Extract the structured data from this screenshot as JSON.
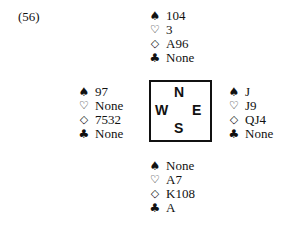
{
  "problem_label": "(56)",
  "suit_symbols": {
    "spades": "♠",
    "hearts": "♡",
    "diamonds": "◇",
    "clubs": "♣"
  },
  "compass": {
    "north": "N",
    "west": "W",
    "east": "E",
    "south": "S"
  },
  "hands": {
    "north": {
      "spades": "104",
      "hearts": "3",
      "diamonds": "A96",
      "clubs": "None"
    },
    "west": {
      "spades": "97",
      "hearts": "None",
      "diamonds": "7532",
      "clubs": "None"
    },
    "east": {
      "spades": "J",
      "hearts": "J9",
      "diamonds": "QJ4",
      "clubs": "None"
    },
    "south": {
      "spades": "None",
      "hearts": "A7",
      "diamonds": "K108",
      "clubs": "A"
    }
  }
}
